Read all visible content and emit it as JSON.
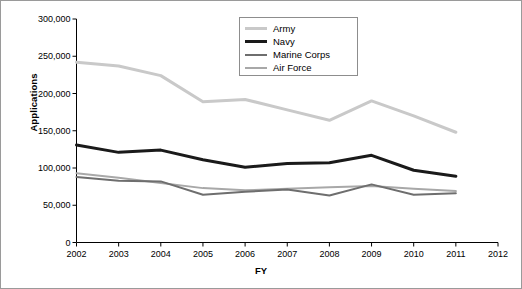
{
  "chart_data": {
    "type": "line",
    "title": "",
    "xlabel": "FY",
    "ylabel": "Applications",
    "x": [
      2002,
      2003,
      2004,
      2005,
      2006,
      2007,
      2008,
      2009,
      2010,
      2011
    ],
    "xticklabels": [
      "2002",
      "2003",
      "2004",
      "2005",
      "2006",
      "2007",
      "2008",
      "2009",
      "2010",
      "2011",
      "2012"
    ],
    "xlim": [
      2002,
      2012
    ],
    "ylim": [
      0,
      300000
    ],
    "yticklabels": [
      "0",
      "50,000",
      "100,000",
      "150,000",
      "200,000",
      "250,000",
      "300,000"
    ],
    "ytickvalues": [
      0,
      50000,
      100000,
      150000,
      200000,
      250000,
      300000
    ],
    "grid": false,
    "legend_position": "top-center",
    "series": [
      {
        "name": "Army",
        "color": "#c9c9c9",
        "width": 3,
        "values": [
          242000,
          237000,
          224000,
          189000,
          192000,
          178000,
          164000,
          190000,
          170000,
          148000
        ]
      },
      {
        "name": "Navy",
        "color": "#1a1a1a",
        "width": 3,
        "values": [
          131000,
          121000,
          124000,
          111000,
          101000,
          106000,
          107000,
          117000,
          97000,
          89000
        ]
      },
      {
        "name": "Marine Corps",
        "color": "#6e6e6e",
        "width": 2,
        "values": [
          88000,
          83000,
          82000,
          64000,
          68000,
          71000,
          63000,
          78000,
          64000,
          66000
        ]
      },
      {
        "name": "Air Force",
        "color": "#a8a8a8",
        "width": 2,
        "values": [
          93000,
          87000,
          80000,
          73000,
          70000,
          72000,
          74000,
          76000,
          72000,
          69000
        ]
      }
    ]
  }
}
